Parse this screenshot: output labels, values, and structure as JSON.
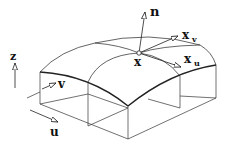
{
  "diagram": {
    "type": "parametric-surface-patch",
    "labels": {
      "normal": "n",
      "point": "x",
      "tangent_v": "x",
      "tangent_v_sub": "v",
      "tangent_u": "x",
      "tangent_u_sub": "u",
      "axis_z": "z",
      "axis_u": "u",
      "axis_v": "v"
    },
    "colors": {
      "stroke": "#222222",
      "background": "#ffffff"
    }
  }
}
